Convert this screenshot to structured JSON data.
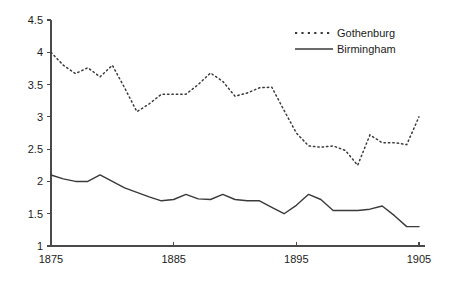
{
  "chart_data": {
    "type": "line",
    "title": "",
    "subtitle": "",
    "xlabel": "",
    "ylabel": "",
    "xlim": [
      1875,
      1905
    ],
    "ylim": [
      1,
      4.5
    ],
    "grid": false,
    "legend_position": "top-right",
    "x_ticks": [
      1875,
      1885,
      1895,
      1905
    ],
    "x_tick_labels": [
      "1875",
      "1885",
      "1895",
      "1905"
    ],
    "y_ticks": [
      1,
      1.5,
      2,
      2.5,
      3,
      3.5,
      4,
      4.5
    ],
    "y_tick_labels": [
      "1",
      "1.5",
      "2",
      "2.5",
      "3",
      "3.5",
      "4",
      "4.5"
    ],
    "x": [
      1875,
      1876,
      1877,
      1878,
      1879,
      1880,
      1881,
      1882,
      1883,
      1884,
      1885,
      1886,
      1887,
      1888,
      1889,
      1890,
      1891,
      1892,
      1893,
      1894,
      1895,
      1896,
      1897,
      1898,
      1899,
      1900,
      1901,
      1902,
      1903,
      1904,
      1905
    ],
    "series": [
      {
        "name": "Gothenburg",
        "style": "dotted",
        "color": "#3a3a3a",
        "values": [
          4.0,
          3.8,
          3.67,
          3.76,
          3.62,
          3.8,
          3.45,
          3.08,
          3.2,
          3.35,
          3.35,
          3.35,
          3.5,
          3.68,
          3.55,
          3.32,
          3.37,
          3.45,
          3.46,
          3.1,
          2.75,
          2.55,
          2.53,
          2.55,
          2.48,
          2.25,
          2.72,
          2.6,
          2.6,
          2.57,
          3.0
        ]
      },
      {
        "name": "Birmingham",
        "style": "solid",
        "color": "#3a3a3a",
        "values": [
          2.1,
          2.04,
          2.0,
          2.0,
          2.1,
          2.0,
          1.9,
          1.83,
          1.76,
          1.7,
          1.72,
          1.8,
          1.73,
          1.72,
          1.8,
          1.72,
          1.7,
          1.7,
          1.6,
          1.5,
          1.63,
          1.8,
          1.72,
          1.55,
          1.55,
          1.55,
          1.57,
          1.62,
          1.47,
          1.3,
          1.3
        ]
      }
    ],
    "legend": [
      {
        "label": "Gothenburg",
        "style": "dotted"
      },
      {
        "label": "Birmingham",
        "style": "solid"
      }
    ]
  },
  "geometry": {
    "plot_left": 51,
    "plot_right": 419,
    "plot_top": 20,
    "plot_bottom": 246,
    "legend_x": 337,
    "legend_y_first": 33,
    "legend_y_second": 49,
    "legend_sample_x1": 295,
    "legend_sample_x2": 333
  }
}
